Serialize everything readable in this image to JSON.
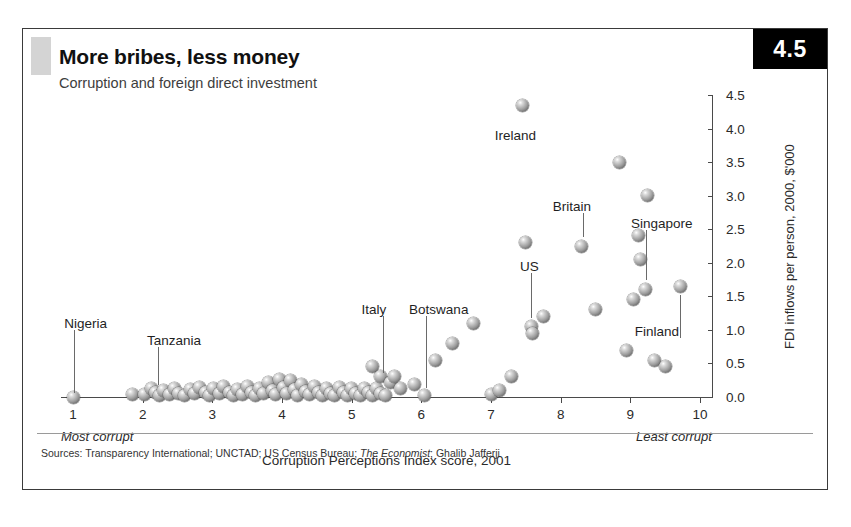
{
  "figure": {
    "number_badge": "4.5",
    "title": "More bribes, less money",
    "subtitle": "Corruption and foreign direct investment",
    "sources_prefix": "Sources: Transparency International; UNCTAD; US Census Bureau; ",
    "sources_italic": "The Economist",
    "sources_suffix": "; Ghalib Jafferji"
  },
  "chart_data": {
    "type": "scatter",
    "title": "More bribes, less money",
    "subtitle": "Corruption and foreign direct investment",
    "xlabel": "Corruption Perceptions Index score, 2001",
    "ylabel": "FDI inflows per person, 2000, $'000",
    "xlim": [
      1,
      10
    ],
    "ylim": [
      0.0,
      4.5
    ],
    "grid": false,
    "y_axis_side": "right",
    "xticks": [
      1,
      2,
      3,
      4,
      5,
      6,
      7,
      8,
      9,
      10
    ],
    "xticklabels": [
      "1",
      "2",
      "3",
      "4",
      "5",
      "6",
      "7",
      "8",
      "9",
      "10"
    ],
    "yticks": [
      0.0,
      0.5,
      1.0,
      1.5,
      2.0,
      2.5,
      3.0,
      3.5,
      4.0,
      4.5
    ],
    "yticklabels": [
      "0.0",
      "0.5",
      "1.0",
      "1.5",
      "2.0",
      "2.5",
      "3.0",
      "3.5",
      "4.0",
      "4.5"
    ],
    "x_axis_note_left": "Most corrupt",
    "x_axis_note_right": "Least corrupt",
    "marker_style": "shaded-sphere",
    "points": [
      [
        1.0,
        0.0
      ],
      [
        1.85,
        0.04
      ],
      [
        2.02,
        0.03
      ],
      [
        2.12,
        0.12
      ],
      [
        2.18,
        0.06
      ],
      [
        2.24,
        0.02
      ],
      [
        2.3,
        0.1
      ],
      [
        2.38,
        0.04
      ],
      [
        2.46,
        0.13
      ],
      [
        2.52,
        0.05
      ],
      [
        2.6,
        0.02
      ],
      [
        2.68,
        0.11
      ],
      [
        2.74,
        0.05
      ],
      [
        2.82,
        0.14
      ],
      [
        2.9,
        0.06
      ],
      [
        2.96,
        0.02
      ],
      [
        3.02,
        0.12
      ],
      [
        3.1,
        0.05
      ],
      [
        3.16,
        0.15
      ],
      [
        3.24,
        0.07
      ],
      [
        3.3,
        0.02
      ],
      [
        3.36,
        0.11
      ],
      [
        3.44,
        0.04
      ],
      [
        3.5,
        0.16
      ],
      [
        3.56,
        0.07
      ],
      [
        3.62,
        0.02
      ],
      [
        3.68,
        0.13
      ],
      [
        3.74,
        0.05
      ],
      [
        3.8,
        0.22
      ],
      [
        3.86,
        0.09
      ],
      [
        3.9,
        0.03
      ],
      [
        3.96,
        0.26
      ],
      [
        4.02,
        0.14
      ],
      [
        4.06,
        0.05
      ],
      [
        4.12,
        0.24
      ],
      [
        4.18,
        0.11
      ],
      [
        4.22,
        0.02
      ],
      [
        4.28,
        0.19
      ],
      [
        4.34,
        0.08
      ],
      [
        4.4,
        0.03
      ],
      [
        4.46,
        0.16
      ],
      [
        4.52,
        0.06
      ],
      [
        4.58,
        0.02
      ],
      [
        4.64,
        0.13
      ],
      [
        4.7,
        0.05
      ],
      [
        4.76,
        0.02
      ],
      [
        4.82,
        0.14
      ],
      [
        4.88,
        0.06
      ],
      [
        4.94,
        0.02
      ],
      [
        5.0,
        0.12
      ],
      [
        5.06,
        0.05
      ],
      [
        5.12,
        0.02
      ],
      [
        5.18,
        0.13
      ],
      [
        5.24,
        0.06
      ],
      [
        5.3,
        0.02
      ],
      [
        5.36,
        0.12
      ],
      [
        5.42,
        0.05
      ],
      [
        5.48,
        0.02
      ],
      [
        5.3,
        0.45
      ],
      [
        5.42,
        0.3
      ],
      [
        5.56,
        0.22
      ],
      [
        5.62,
        0.3
      ],
      [
        5.7,
        0.12
      ],
      [
        5.9,
        0.18
      ],
      [
        6.05,
        0.02
      ],
      [
        6.2,
        0.55
      ],
      [
        6.45,
        0.8
      ],
      [
        6.75,
        1.1
      ],
      [
        7.0,
        0.04
      ],
      [
        7.12,
        0.1
      ],
      [
        7.3,
        0.3
      ],
      [
        7.45,
        4.35
      ],
      [
        7.5,
        2.3
      ],
      [
        7.58,
        1.05
      ],
      [
        7.6,
        0.95
      ],
      [
        7.75,
        1.2
      ],
      [
        8.3,
        2.25
      ],
      [
        8.5,
        1.3
      ],
      [
        8.85,
        3.5
      ],
      [
        8.95,
        0.7
      ],
      [
        9.05,
        1.45
      ],
      [
        9.12,
        2.4
      ],
      [
        9.15,
        2.05
      ],
      [
        9.25,
        3.0
      ],
      [
        9.22,
        1.6
      ],
      [
        9.35,
        0.55
      ],
      [
        9.5,
        0.45
      ],
      [
        9.72,
        1.65
      ]
    ],
    "annotations": [
      {
        "label": "Nigeria",
        "label_x": 1.18,
        "label_y": 1.08,
        "target_x": 1.02,
        "target_y": 0.06
      },
      {
        "label": "Tanzania",
        "label_x": 2.45,
        "label_y": 0.82,
        "target_x": 2.22,
        "target_y": 0.18
      },
      {
        "label": "Italy",
        "label_x": 5.32,
        "label_y": 1.28,
        "target_x": 5.45,
        "target_y": 0.36
      },
      {
        "label": "Botswana",
        "label_x": 6.25,
        "label_y": 1.28,
        "target_x": 6.06,
        "target_y": 0.14
      },
      {
        "label": "US",
        "label_x": 7.55,
        "label_y": 1.92,
        "target_x": 7.58,
        "target_y": 1.18
      },
      {
        "label": "Britain",
        "label_x": 8.16,
        "label_y": 2.82,
        "target_x": 8.32,
        "target_y": 2.38
      },
      {
        "label": "Singapore",
        "label_x": 9.45,
        "label_y": 2.56,
        "target_x": 9.22,
        "target_y": 1.74
      },
      {
        "label": "Ireland",
        "label_x": 7.35,
        "label_y": 3.88,
        "target_x": null,
        "target_y": null
      },
      {
        "label": "Finland",
        "label_x": 9.38,
        "label_y": 0.96,
        "target_x": 9.72,
        "target_y": 1.52
      }
    ]
  }
}
